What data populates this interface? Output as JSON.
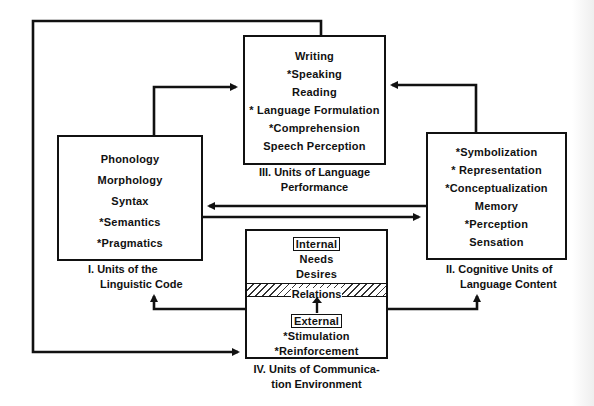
{
  "diagram": {
    "box_linguistic_code": {
      "numeral_label": "I. Units of the",
      "label_line2": "Linguistic Code",
      "items": [
        "Phonology",
        "Morphology",
        "Syntax",
        "*Semantics",
        "*Pragmatics"
      ]
    },
    "box_cognitive_units": {
      "numeral_label": "II. Cognitive Units of",
      "label_line2": "Language Content",
      "items": [
        "*Symbolization",
        "* Representation",
        "*Conceptualization",
        "Memory",
        "*Perception",
        "Sensation"
      ]
    },
    "box_language_performance": {
      "numeral_label": "III. Units of Language",
      "label_line2": "Performance",
      "items": [
        "Writing",
        "*Speaking",
        "Reading",
        "* Language Formulation",
        "*Comprehension",
        "Speech Perception"
      ]
    },
    "box_communication_environment": {
      "numeral_label": "IV. Units of Communica-",
      "label_line2": "tion Environment",
      "internal_heading": "Internal",
      "internal_items": [
        "Needs",
        "Desires"
      ],
      "relations_label": "Relations",
      "external_heading": "External",
      "external_items": [
        "*Stimulation",
        "*Reinforcement"
      ]
    },
    "connections": [
      {
        "from": "I",
        "to": "III",
        "type": "arrow"
      },
      {
        "from": "II",
        "to": "III",
        "type": "arrow"
      },
      {
        "from": "II",
        "to": "I",
        "type": "arrow"
      },
      {
        "from": "I",
        "to": "II",
        "type": "arrow"
      },
      {
        "from": "IV",
        "to": "I",
        "type": "arrow"
      },
      {
        "from": "IV",
        "to": "II",
        "type": "arrow"
      },
      {
        "from": "III",
        "to": "IV",
        "type": "arrow",
        "route": "outer-left-loop"
      },
      {
        "from": "External",
        "to": "Relations",
        "type": "arrow"
      }
    ],
    "colors": {
      "ink": "#111111",
      "background": "#ffffff"
    }
  }
}
